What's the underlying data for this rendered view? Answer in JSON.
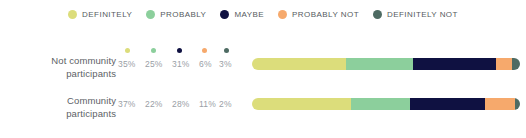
{
  "legend": {
    "items": [
      {
        "label": "DEFINITELY",
        "color": "#dcdd7b",
        "icon": "legend-dot-icon"
      },
      {
        "label": "PROBABLY",
        "color": "#8ccf9c",
        "icon": "legend-dot-icon"
      },
      {
        "label": "MAYBE",
        "color": "#0f1141",
        "icon": "legend-dot-icon"
      },
      {
        "label": "PROBABLY NOT",
        "color": "#f6a96c",
        "icon": "legend-dot-icon"
      },
      {
        "label": "DEFINITELY NOT",
        "color": "#4e6b63",
        "icon": "legend-dot-icon"
      }
    ]
  },
  "rows": [
    {
      "label_line1": "Not community",
      "label_line2": "participants",
      "values": [
        "35%",
        "25%",
        "31%",
        "6%",
        "3%"
      ],
      "show_dots": true
    },
    {
      "label_line1": "Community",
      "label_line2": "participants",
      "values": [
        "37%",
        "22%",
        "28%",
        "11%",
        "2%"
      ],
      "show_dots": false
    }
  ],
  "chart_data": {
    "type": "bar",
    "title": "",
    "xlabel": "",
    "ylabel": "",
    "orientation": "horizontal",
    "stacked": true,
    "normalized": true,
    "grid": false,
    "legend_position": "top-center",
    "xlim": [
      0,
      100
    ],
    "categories": [
      "Not community participants",
      "Community participants"
    ],
    "series": [
      {
        "name": "DEFINITELY",
        "color": "#dcdd7b",
        "values": [
          35,
          37
        ]
      },
      {
        "name": "PROBABLY",
        "color": "#8ccf9c",
        "values": [
          25,
          22
        ]
      },
      {
        "name": "MAYBE",
        "color": "#0f1141",
        "values": [
          31,
          28
        ]
      },
      {
        "name": "PROBABLY NOT",
        "color": "#f6a96c",
        "values": [
          6,
          11
        ]
      },
      {
        "name": "DEFINITELY NOT",
        "color": "#4e6b63",
        "values": [
          3,
          2
        ]
      }
    ],
    "data_labels": [
      [
        "35%",
        "25%",
        "31%",
        "6%",
        "3%"
      ],
      [
        "37%",
        "22%",
        "28%",
        "11%",
        "2%"
      ]
    ]
  }
}
